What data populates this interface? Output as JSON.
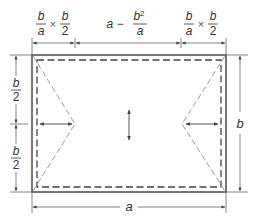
{
  "diagram": {
    "colors": {
      "outline": "#555555",
      "dashed": "#444444",
      "dimension": "#666666",
      "notch": "#9a9a9a",
      "text": "#333333"
    },
    "top_dimensions": [
      {
        "id": "left",
        "num": "b",
        "den": "a",
        "op": "×",
        "num2": "b",
        "den2": "2"
      },
      {
        "id": "middle",
        "prefix": "a −",
        "num": "b²",
        "num_base": "b",
        "num_sup": "2",
        "den": "a"
      },
      {
        "id": "right",
        "num": "b",
        "den": "a",
        "op": "×",
        "num2": "b",
        "den2": "2"
      }
    ],
    "left_dimensions": [
      {
        "id": "upper-half",
        "num": "b",
        "den": "2"
      },
      {
        "id": "lower-half",
        "num": "b",
        "den": "2"
      }
    ],
    "right_dimension": {
      "label": "b"
    },
    "bottom_dimension": {
      "label": "a"
    }
  }
}
